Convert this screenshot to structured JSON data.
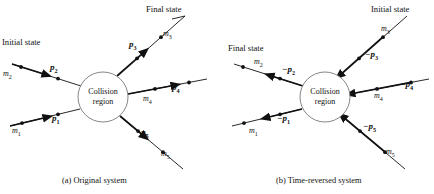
{
  "figure": {
    "width": 434,
    "height": 194,
    "line_color": "#111111",
    "circle_stroke": "#666666",
    "background": "#ffffff"
  },
  "panels": [
    {
      "id": "a",
      "caption": "(a) Original system",
      "center": {
        "x": 103,
        "y": 97,
        "r": 25
      },
      "region_label_line1": "Collision",
      "region_label_line2": "region",
      "state_labels": [
        {
          "name": "initial-state-label",
          "text": "Initial state",
          "x": 2,
          "y": 38
        },
        {
          "name": "final-state-label",
          "text": "Final state",
          "x": 146,
          "y": 5
        }
      ],
      "particles": [
        {
          "name": "p2",
          "mass": "m",
          "mass_sub": "2",
          "mom": "p",
          "mom_sub": "2",
          "mom_prefix": "",
          "role": "incoming",
          "mass_x": 3,
          "mass_y": 70,
          "mom_x": 50,
          "mom_y": 63
        },
        {
          "name": "p1",
          "mass": "m",
          "mass_sub": "1",
          "mom": "p",
          "mom_sub": "1",
          "mom_prefix": "",
          "role": "incoming",
          "mass_x": 12,
          "mass_y": 127,
          "mom_x": 52,
          "mom_y": 114
        },
        {
          "name": "p3",
          "mass": "m",
          "mass_sub": "3",
          "mom": "p",
          "mom_sub": "3",
          "mom_prefix": "",
          "role": "outgoing",
          "mass_x": 163,
          "mass_y": 30,
          "mom_x": 129,
          "mom_y": 40
        },
        {
          "name": "p4",
          "mass": "m",
          "mass_sub": "4",
          "mom": "p",
          "mom_sub": "4",
          "mom_prefix": "",
          "role": "outgoing",
          "mass_x": 143,
          "mass_y": 95,
          "mom_x": 172,
          "mom_y": 83
        },
        {
          "name": "p5",
          "mass": "m",
          "mass_sub": "5",
          "mom": "p",
          "mom_sub": "5",
          "mom_prefix": "",
          "role": "outgoing",
          "mass_x": 161,
          "mass_y": 150,
          "mom_x": 141,
          "mom_y": 128
        }
      ]
    },
    {
      "id": "b",
      "caption": "(b) Time-reversed system",
      "center": {
        "x": 325,
        "y": 97,
        "r": 25
      },
      "region_label_line1": "Collision",
      "region_label_line2": "region",
      "state_labels": [
        {
          "name": "final-state-label",
          "text": "Final state",
          "x": 228,
          "y": 44
        },
        {
          "name": "initial-state-label",
          "text": "Initial state",
          "x": 371,
          "y": 5
        }
      ],
      "particles": [
        {
          "name": "p2",
          "mass": "m",
          "mass_sub": "2",
          "mom": "p",
          "mom_sub": "2",
          "mom_prefix": "−",
          "role": "outgoing",
          "mass_x": 254,
          "mass_y": 58,
          "mom_x": 282,
          "mom_y": 65
        },
        {
          "name": "p1",
          "mass": "m",
          "mass_sub": "1",
          "mom": "p",
          "mom_sub": "1",
          "mom_prefix": "−",
          "role": "outgoing",
          "mass_x": 249,
          "mass_y": 127,
          "mom_x": 277,
          "mom_y": 114
        },
        {
          "name": "p3",
          "mass": "m",
          "mass_sub": "3",
          "mom": "p",
          "mom_sub": "3",
          "mom_prefix": "−",
          "role": "incoming",
          "mass_x": 381,
          "mass_y": 25,
          "mom_x": 365,
          "mom_y": 50
        },
        {
          "name": "p4",
          "mass": "m",
          "mass_sub": "4",
          "mom": "p",
          "mom_sub": "4",
          "mom_prefix": "−",
          "role": "incoming",
          "mass_x": 374,
          "mass_y": 92,
          "mom_x": 400,
          "mom_y": 80
        },
        {
          "name": "p5",
          "mass": "m",
          "mass_sub": "5",
          "mom": "p",
          "mom_sub": "5",
          "mom_prefix": "−",
          "role": "incoming",
          "mass_x": 386,
          "mass_y": 148,
          "mom_x": 363,
          "mom_y": 122
        }
      ]
    }
  ],
  "captions": [
    {
      "name": "caption-a",
      "text": "(a) Original system",
      "x": 62,
      "y": 177
    },
    {
      "name": "caption-b",
      "text": "(b) Time-reversed system",
      "x": 276,
      "y": 177
    }
  ]
}
